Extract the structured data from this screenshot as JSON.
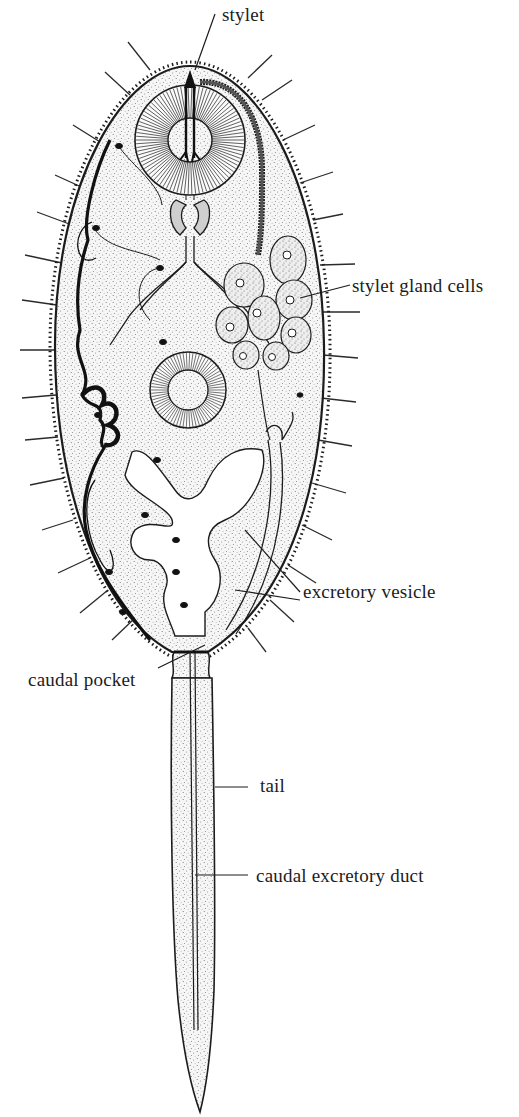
{
  "figure": {
    "labels": {
      "stylet": "stylet",
      "stylet_gland_cells": "stylet gland cells",
      "excretory_vesicle": "excretory vesicle",
      "caudal_pocket": "caudal pocket",
      "tail": "tail",
      "caudal_excretory_duct": "caudal excretory duct"
    },
    "colors": {
      "ink": "#1c1c1c",
      "stipple": "#6a6a6a",
      "background": "#ffffff",
      "body_fill": "#f3f3f3"
    }
  }
}
